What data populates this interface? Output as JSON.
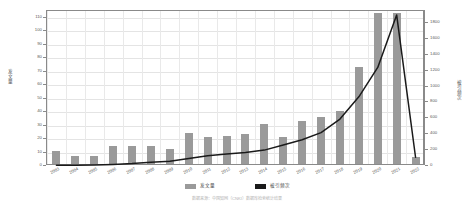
{
  "chart_data": {
    "type": "bar",
    "title": "",
    "subtitle": "",
    "xlabel": "",
    "ylabel": "发文量",
    "y2label": "被引频次",
    "grid": true,
    "legend_position": "bottom",
    "ylim": [
      0,
      115
    ],
    "y2lim": [
      0,
      1950
    ],
    "y_ticks": [
      0,
      10,
      20,
      30,
      40,
      50,
      60,
      70,
      80,
      90,
      100,
      110
    ],
    "y2_ticks": [
      0,
      200,
      400,
      600,
      800,
      1000,
      1200,
      1400,
      1600,
      1800
    ],
    "categories": [
      "2003",
      "2004",
      "2005",
      "2006",
      "2007",
      "2008",
      "2009",
      "2010",
      "2011",
      "2012",
      "2013",
      "2014",
      "2015",
      "2016",
      "2017",
      "2018",
      "2019",
      "2020",
      "2021",
      "2022"
    ],
    "series": [
      {
        "name": "发文量",
        "type": "bar",
        "axis": "left",
        "color": "#9a9a9a",
        "values": [
          10,
          6,
          6,
          13,
          13,
          13,
          11,
          23,
          20,
          21,
          22,
          30,
          20,
          32,
          35,
          39,
          72,
          112,
          112,
          5
        ]
      },
      {
        "name": "被引频次",
        "type": "line",
        "axis": "right",
        "color": "#1a1a1a",
        "values": [
          8,
          10,
          14,
          20,
          30,
          46,
          60,
          95,
          130,
          150,
          170,
          200,
          265,
          330,
          420,
          590,
          870,
          1240,
          1900,
          110
        ]
      }
    ],
    "caption": "数据来源：中国知网（CNKI）数据库检索统计结果"
  },
  "legend": {
    "items": [
      {
        "label": "发文量",
        "color": "#9a9a9a"
      },
      {
        "label": "被引频次",
        "color": "#1a1a1a"
      }
    ]
  },
  "axes": {
    "left_title": "发文量",
    "right_title": "被引频次"
  }
}
